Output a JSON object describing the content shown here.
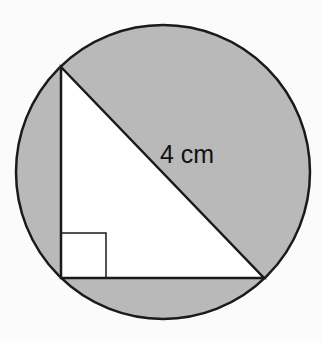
{
  "diagram": {
    "hypotenuse_label": "4 cm",
    "colors": {
      "background": "#fbfbfb",
      "shaded": "#b9b9b9",
      "triangle_fill": "#ffffff",
      "stroke": "#1a1a1a"
    },
    "circle": {
      "cx": 163,
      "cy": 172,
      "r": 147
    },
    "triangle": {
      "vertices": [
        [
          61,
          67
        ],
        [
          61,
          278
        ],
        [
          264,
          278
        ]
      ],
      "right_angle_at": [
        61,
        278
      ]
    }
  }
}
